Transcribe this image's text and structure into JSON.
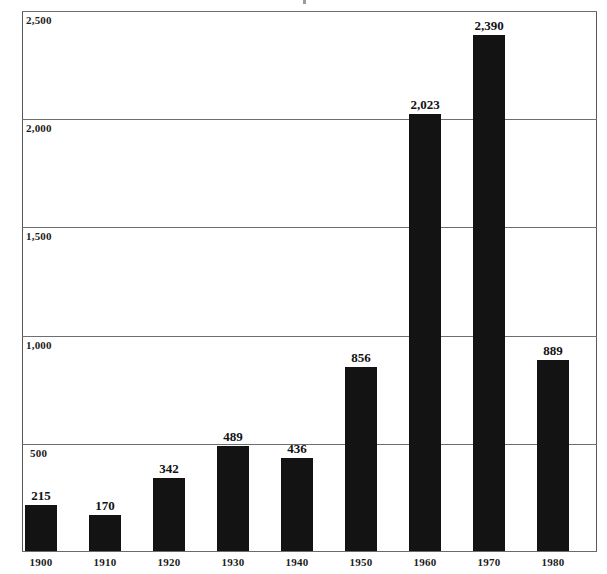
{
  "chart_data": {
    "type": "bar",
    "title": "",
    "xlabel": "",
    "ylabel": "",
    "categories": [
      "1900",
      "1910",
      "1920",
      "1930",
      "1940",
      "1950",
      "1960",
      "1970",
      "1980"
    ],
    "values": [
      215,
      170,
      342,
      489,
      436,
      856,
      2023,
      2390,
      889
    ],
    "value_labels": [
      "215",
      "170",
      "342",
      "489",
      "436",
      "856",
      "2,023",
      "2,390",
      "889"
    ],
    "ylim": [
      0,
      2500
    ],
    "ytick_values": [
      500,
      1000,
      1500,
      2000,
      2500
    ],
    "ytick_labels": [
      "500",
      "1,000",
      "1,500",
      "2,000",
      "2,500"
    ],
    "grid": true,
    "legend": false,
    "legend_position": "none",
    "bar_color": "#131313",
    "gridline_color": "#6e6e6e",
    "axis_color": "#585858",
    "background_color": "#ffffff"
  }
}
